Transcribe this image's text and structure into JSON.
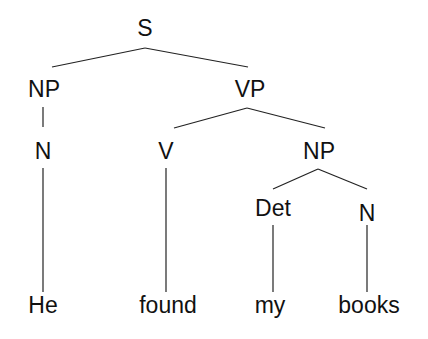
{
  "diagram": {
    "type": "syntax-tree",
    "sentence": "He found my books",
    "nodes": {
      "S": "S",
      "NP1": "NP",
      "VP": "VP",
      "N1": "N",
      "V": "V",
      "NP2": "NP",
      "Det": "Det",
      "N2": "N",
      "w1": "He",
      "w2": "found",
      "w3": "my",
      "w4": "books"
    },
    "edges": [
      [
        "S",
        "NP1"
      ],
      [
        "S",
        "VP"
      ],
      [
        "NP1",
        "N1"
      ],
      [
        "VP",
        "V"
      ],
      [
        "VP",
        "NP2"
      ],
      [
        "NP2",
        "Det"
      ],
      [
        "NP2",
        "N2"
      ],
      [
        "N1",
        "w1"
      ],
      [
        "V",
        "w2"
      ],
      [
        "Det",
        "w3"
      ],
      [
        "N2",
        "w4"
      ]
    ]
  }
}
